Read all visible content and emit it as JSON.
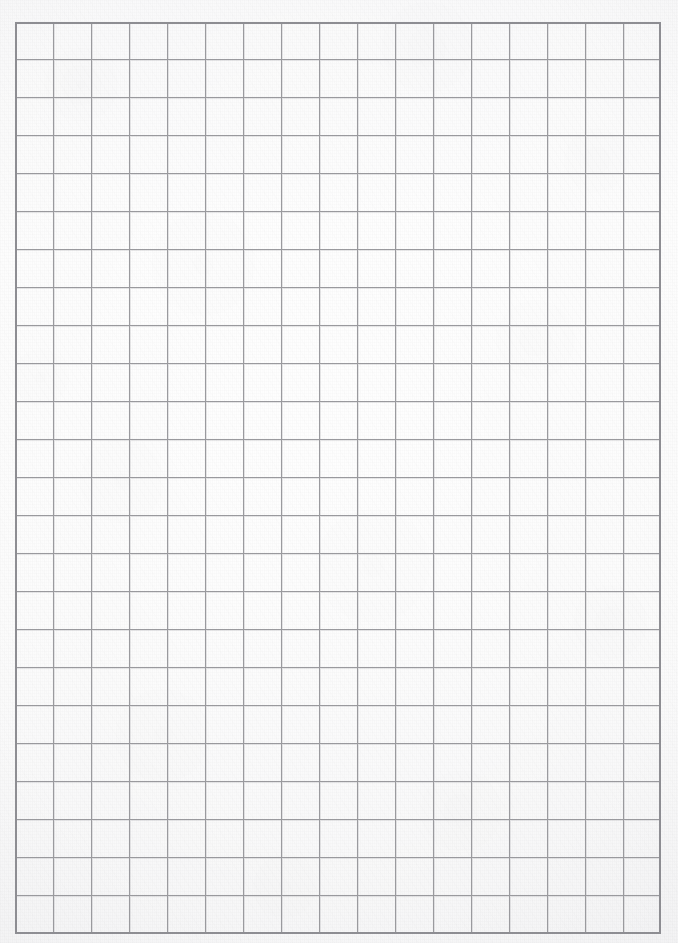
{
  "document": {
    "kind": "grid-paper-scan",
    "title": "Blank graph paper sheet",
    "page_width": 678,
    "page_height": 943,
    "visible_text": "",
    "annotations": []
  },
  "colors": {
    "page_background": "#ffffff",
    "paper_fill": "#fbfbfb",
    "paper_shadow_tint": "#ececee",
    "grid_line": "#9a9a9e",
    "grid_line_light": "#b4b4b8",
    "grid_border": "#8e8e93"
  },
  "grid": {
    "columns": 17,
    "rows": 24,
    "cell_width": 38,
    "cell_height": 38,
    "left": 15,
    "top": 22,
    "width": 646,
    "height": 912,
    "line_width": 1,
    "border_width": 2,
    "line_color": "#9a9a9e",
    "border_color": "#8e8e93"
  }
}
